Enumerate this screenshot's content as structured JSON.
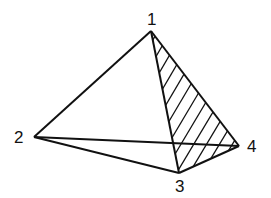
{
  "diagram": {
    "type": "tetrahedron",
    "vertices": [
      {
        "id": "1",
        "label": "1"
      },
      {
        "id": "2",
        "label": "2"
      },
      {
        "id": "3",
        "label": "3"
      },
      {
        "id": "4",
        "label": "4"
      }
    ],
    "edges": [
      [
        "1",
        "2"
      ],
      [
        "1",
        "3"
      ],
      [
        "1",
        "4"
      ],
      [
        "2",
        "3"
      ],
      [
        "2",
        "4"
      ],
      [
        "3",
        "4"
      ]
    ],
    "shaded_face": [
      "1",
      "3",
      "4"
    ],
    "colors": {
      "stroke": "#111111",
      "background": "#ffffff"
    }
  }
}
